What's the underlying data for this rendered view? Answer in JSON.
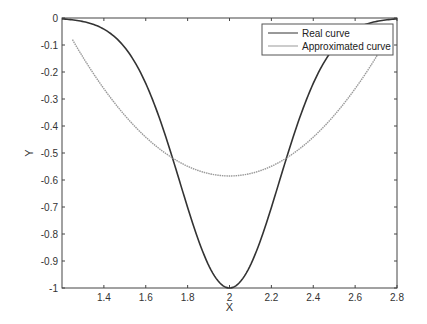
{
  "chart_data": {
    "type": "line",
    "title": "",
    "xlabel": "X",
    "ylabel": "Y",
    "xlim": [
      1.2,
      2.8
    ],
    "ylim": [
      -1,
      0
    ],
    "grid": false,
    "legend_position": "upper right",
    "xticks": [
      1.4,
      1.6,
      1.8,
      2,
      2.2,
      2.4,
      2.6,
      2.8
    ],
    "xtick_labels": [
      "1.4",
      "1.6",
      "1.8",
      "2",
      "2.2",
      "2.4",
      "2.6",
      "2.8"
    ],
    "yticks": [
      0,
      -0.1,
      -0.2,
      -0.3,
      -0.4,
      -0.5,
      -0.6,
      -0.7,
      -0.8,
      -0.9,
      -1
    ],
    "ytick_labels": [
      "0",
      "-0.1",
      "-0.2",
      "-0.3",
      "-0.4",
      "-0.5",
      "-0.6",
      "-0.7",
      "-0.8",
      "-0.9",
      "-1"
    ],
    "series": [
      {
        "name": "Real curve",
        "color": "#333333",
        "x": [
          1.2,
          1.3,
          1.4,
          1.5,
          1.6,
          1.7,
          1.72,
          1.8,
          1.9,
          2.0,
          2.1,
          2.2,
          2.28,
          2.3,
          2.4,
          2.5,
          2.6,
          2.7,
          2.8
        ],
        "values": [
          -0.004,
          -0.013,
          -0.041,
          -0.109,
          -0.242,
          -0.451,
          -0.5,
          -0.702,
          -0.915,
          -1.0,
          -0.915,
          -0.702,
          -0.5,
          -0.451,
          -0.242,
          -0.109,
          -0.041,
          -0.013,
          -0.004
        ]
      },
      {
        "name": "Approximated curve",
        "color": "#999999",
        "x": [
          1.25,
          1.3,
          1.4,
          1.5,
          1.6,
          1.7,
          1.8,
          1.9,
          2.0,
          2.1,
          2.2,
          2.3,
          2.4,
          2.5,
          2.6,
          2.7,
          2.75
        ],
        "values": [
          -0.08,
          -0.12,
          -0.22,
          -0.31,
          -0.39,
          -0.47,
          -0.53,
          -0.57,
          -0.585,
          -0.57,
          -0.53,
          -0.47,
          -0.39,
          -0.31,
          -0.22,
          -0.12,
          -0.08
        ]
      }
    ]
  },
  "legend": {
    "items": [
      {
        "label": "Real curve",
        "color": "#333333"
      },
      {
        "label": "Approximated curve",
        "color": "#999999"
      }
    ]
  }
}
